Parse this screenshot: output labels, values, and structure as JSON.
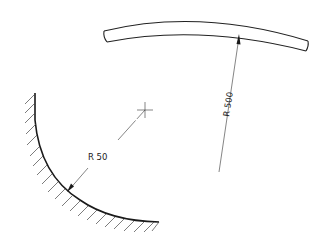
{
  "figure": {
    "type": "technical-drawing",
    "colors": {
      "line": "#222222",
      "background": "#ffffff"
    }
  },
  "dimensions": {
    "large_radius": {
      "label": "R 500",
      "target": "curved-bar"
    },
    "small_radius": {
      "label": "R 50",
      "target": "hatched-concave-arc"
    }
  },
  "symbols": {
    "center_mark": "center-cross",
    "hatching": "section-hatch"
  }
}
